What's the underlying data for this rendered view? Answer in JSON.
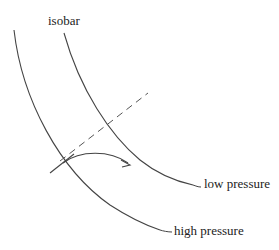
{
  "diagram": {
    "labels": {
      "isobar": "isobar",
      "low_pressure": "low pressure",
      "high_pressure": "high pressure"
    },
    "elements": [
      {
        "type": "isobar-curve",
        "role": "high pressure (outer)"
      },
      {
        "type": "isobar-curve",
        "role": "low pressure (inner)"
      },
      {
        "type": "dashed-line",
        "role": "pressure gradient direction"
      },
      {
        "type": "tangent-line",
        "role": "tangent at point"
      },
      {
        "type": "curved-arrow",
        "role": "deflected motion"
      }
    ],
    "colors": {
      "line": "#444444",
      "text": "#222222"
    }
  }
}
